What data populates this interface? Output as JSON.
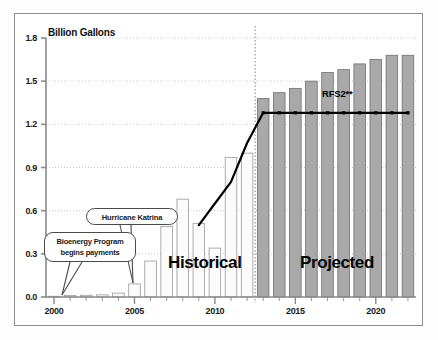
{
  "chart_data": {
    "type": "bar",
    "title": "",
    "subtitle": "",
    "ylabel": "Billion Gallons",
    "xlabel": "",
    "ylim": [
      0.0,
      1.8
    ],
    "yticks": [
      0.0,
      0.3,
      0.6,
      0.9,
      1.2,
      1.5,
      1.8
    ],
    "ytick_labels": [
      "0.0",
      "0.3",
      "0.6",
      "0.9",
      "1.2",
      "1.5",
      "1.8"
    ],
    "xlim": [
      1999.5,
      2022.5
    ],
    "xticks": [
      2000,
      2005,
      2010,
      2015,
      2020
    ],
    "xtick_labels": [
      "2000",
      "2005",
      "2010",
      "2015",
      "2020"
    ],
    "grid": true,
    "grid_style": "dotted-horizontal",
    "legend": "none",
    "categories": [
      2000,
      2001,
      2002,
      2003,
      2004,
      2005,
      2006,
      2007,
      2008,
      2009,
      2010,
      2011,
      2012,
      2013,
      2014,
      2015,
      2016,
      2017,
      2018,
      2019,
      2020,
      2021,
      2022
    ],
    "series": [
      {
        "name": "Biodiesel production",
        "type": "bar",
        "values": [
          0.005,
          0.01,
          0.012,
          0.015,
          0.027,
          0.091,
          0.25,
          0.49,
          0.68,
          0.51,
          0.34,
          0.97,
          1.0,
          1.38,
          1.42,
          1.45,
          1.5,
          1.56,
          1.58,
          1.62,
          1.65,
          1.68,
          1.68
        ],
        "bar_colors": [
          "historical",
          "historical",
          "historical",
          "historical",
          "historical",
          "historical",
          "historical",
          "historical",
          "historical",
          "historical",
          "historical",
          "historical",
          "historical",
          "projected",
          "projected",
          "projected",
          "projected",
          "projected",
          "projected",
          "projected",
          "projected",
          "projected",
          "projected"
        ]
      },
      {
        "name": "RFS2 mandate line",
        "type": "line",
        "points": [
          {
            "x": 2009,
            "y": 0.5
          },
          {
            "x": 2010,
            "y": 0.65
          },
          {
            "x": 2011,
            "y": 0.8
          },
          {
            "x": 2012,
            "y": 1.07
          },
          {
            "x": 2013,
            "y": 1.28
          },
          {
            "x": 2014,
            "y": 1.28
          },
          {
            "x": 2015,
            "y": 1.28
          },
          {
            "x": 2016,
            "y": 1.28
          },
          {
            "x": 2017,
            "y": 1.28
          },
          {
            "x": 2018,
            "y": 1.28
          },
          {
            "x": 2019,
            "y": 1.28
          },
          {
            "x": 2020,
            "y": 1.28
          },
          {
            "x": 2021,
            "y": 1.28
          },
          {
            "x": 2022,
            "y": 1.28
          }
        ]
      }
    ],
    "annotations": [
      {
        "id": "bioenergy",
        "text_line1": "Bioenergy Program",
        "text_line2": "begins payments",
        "points_to_x": 2001,
        "points_to_y": 0.02
      },
      {
        "id": "katrina",
        "text_line1": "Hurricane Katrina",
        "text_line2": "",
        "points_to_x": 2005,
        "points_to_y": 0.1
      },
      {
        "id": "rfs2",
        "text_line1": "RFS2**",
        "text_line2": "",
        "points_to_x": 2017,
        "points_to_y": 1.28
      }
    ],
    "region_labels": [
      {
        "label": "Historical",
        "x_range": [
          2000,
          2012
        ]
      },
      {
        "label": "Projected",
        "x_range": [
          2013,
          2022
        ]
      }
    ],
    "divider_x": 2012.5
  },
  "labels": {
    "y_title": "Billion Gallons",
    "historical": "Historical",
    "projected": "Projected",
    "rfs2": "RFS2**",
    "bioenergy_l1": "Bioenergy Program",
    "bioenergy_l2": "begins payments",
    "katrina": "Hurricane Katrina"
  },
  "colors": {
    "historical_bar_fill": "#fbfbfb",
    "historical_bar_stroke": "#9a9a9a",
    "projected_bar_fill": "#a9a9a9",
    "projected_bar_stroke": "#6f6f6f",
    "line": "#000000",
    "grid": "#b9b9b9",
    "axis": "#8a8a8a",
    "frame": "#8d8d8d",
    "text": "#111111"
  }
}
